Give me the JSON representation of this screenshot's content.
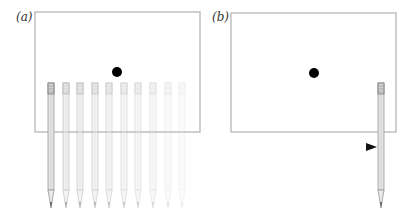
{
  "panels": [
    {
      "label": "(a)",
      "description": "Stationary dot in frame with pencil shown at successive positions (fading trail)",
      "box": {
        "x": 35,
        "y": 12,
        "w": 165,
        "h": 120
      },
      "dot": {
        "cx": 117,
        "cy": 72,
        "r": 5
      },
      "pencils": [
        {
          "x": 51,
          "opacity": 1.0
        },
        {
          "x": 66,
          "opacity": 0.55
        },
        {
          "x": 80,
          "opacity": 0.5
        },
        {
          "x": 95,
          "opacity": 0.45
        },
        {
          "x": 109,
          "opacity": 0.4
        },
        {
          "x": 124,
          "opacity": 0.35
        },
        {
          "x": 138,
          "opacity": 0.3
        },
        {
          "x": 153,
          "opacity": 0.25
        },
        {
          "x": 168,
          "opacity": 0.18
        },
        {
          "x": 182,
          "opacity": 0.12
        }
      ]
    },
    {
      "label": "(b)",
      "description": "Stationary dot in frame, single pencil with motion arrow",
      "box": {
        "x": 231,
        "y": 13,
        "w": 165,
        "h": 119
      },
      "dot": {
        "cx": 314,
        "cy": 73,
        "r": 5
      },
      "pencils": [
        {
          "x": 381,
          "opacity": 1.0
        }
      ],
      "arrow": {
        "x1": 247,
        "x2": 377,
        "y": 147
      }
    }
  ],
  "pencil": {
    "top": 83,
    "ferrule_bottom": 94,
    "shaft_bottom": 190,
    "tip": 208,
    "width": 6
  },
  "colors": {
    "frame": "#b0b0b0",
    "dot": "#000000",
    "pencil": "#9a9a9a",
    "arrow": "#111111"
  }
}
